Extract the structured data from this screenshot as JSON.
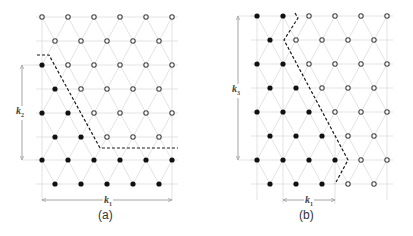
{
  "colors": {
    "filled": "#111111",
    "hollow_stroke": "#444444",
    "lattice": "#dcdcdc",
    "boundary": "#1a1a1a",
    "arrow": "#9a9a9a"
  },
  "panels": [
    {
      "id": "a",
      "caption": "(a)",
      "rows_y": [
        17,
        41,
        65,
        89,
        113,
        137,
        160,
        184
      ],
      "even_x": [
        42,
        68,
        94,
        120,
        146,
        172
      ],
      "odd_x": [
        55,
        81,
        107,
        133,
        159
      ],
      "filled": [
        [],
        [],
        [
          42
        ],
        [
          55
        ],
        [
          42,
          68
        ],
        [
          55,
          81
        ],
        [
          42,
          68,
          94,
          120,
          146,
          172
        ],
        [
          55,
          81,
          107,
          133,
          159
        ]
      ],
      "boundary_path": [
        [
          37,
          55
        ],
        [
          49,
          55
        ],
        [
          100,
          148
        ],
        [
          178,
          148
        ]
      ],
      "dim_vertical": {
        "label": "k",
        "sub": "2",
        "x": 22,
        "y1": 65,
        "y2": 160
      },
      "dim_horizontal": {
        "label": "k",
        "sub": "1",
        "y": 200,
        "x1": 42,
        "x2": 172
      }
    },
    {
      "id": "b",
      "caption": "(b)",
      "rows_y": [
        16,
        40,
        64,
        88,
        112,
        136,
        160,
        184
      ],
      "even_x": [
        257,
        283,
        309,
        335,
        361,
        387
      ],
      "odd_x": [
        270,
        296,
        322,
        348,
        374
      ],
      "filled": [
        [
          257,
          283
        ],
        [
          270
        ],
        [
          257,
          283
        ],
        [
          270,
          296
        ],
        [
          257,
          283,
          309
        ],
        [
          270,
          296,
          322
        ],
        [
          257,
          283,
          309,
          335
        ],
        [
          270,
          296,
          322
        ]
      ],
      "boundary_path": [
        [
          295,
          13
        ],
        [
          298,
          18
        ],
        [
          284,
          40
        ],
        [
          348,
          160
        ],
        [
          335,
          184
        ]
      ],
      "dim_vertical": {
        "label": "k",
        "sub": "3",
        "x": 238,
        "y1": 16,
        "y2": 160
      },
      "dim_horizontal": {
        "label": "k",
        "sub": "1",
        "y": 200,
        "x1": 283,
        "x2": 335
      }
    }
  ]
}
